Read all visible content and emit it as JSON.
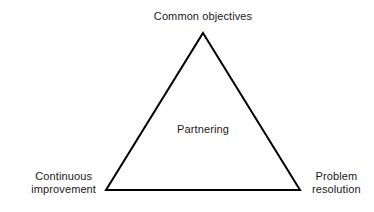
{
  "diagram": {
    "background_color": "#ffffff",
    "stroke_color": "#000000",
    "text_color": "#1a1a1a",
    "shape": {
      "name": "triangle",
      "filled": false,
      "stroke_width": 2,
      "vertices": {
        "apex": {
          "x": 203,
          "y": 33
        },
        "bottom_left": {
          "x": 106,
          "y": 190
        },
        "bottom_right": {
          "x": 300,
          "y": 190
        }
      }
    },
    "center_label": "Partnering",
    "vertex_labels": {
      "top": {
        "lines": [
          "Common objectives"
        ],
        "line1": "Common objectives"
      },
      "bottom_left": {
        "lines": [
          "Continuous",
          "improvement"
        ],
        "line1": "Continuous",
        "line2": "improvement"
      },
      "bottom_right": {
        "lines": [
          "Problem",
          "resolution"
        ],
        "line1": "Problem",
        "line2": "resolution"
      }
    }
  }
}
